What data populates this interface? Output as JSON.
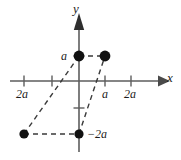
{
  "figure": {
    "kind": "cartesian-coordinate-diagram",
    "background_color": "#ffffff",
    "axis_color": "#5d5d5d",
    "dash_color": "#3a3a3a",
    "point_color": "#111111",
    "text_color": "#1c1c1c",
    "axes": {
      "x_label": "x",
      "y_label": "y",
      "origin_px": {
        "x": 79,
        "y": 81
      },
      "unit_px": 26
    },
    "x_ticks": [
      {
        "value": "-2a",
        "label": "2a",
        "px": 24
      },
      {
        "value": "-a",
        "label": "",
        "px": 52
      },
      {
        "value": "a",
        "label": "a",
        "px": 105
      },
      {
        "value": "2a",
        "label": "2a",
        "px": 131
      }
    ],
    "y_ticks": [
      {
        "value": "a",
        "label": "a",
        "px": 56
      },
      {
        "value": "-a",
        "label": "",
        "px": 108
      },
      {
        "value": "-2a",
        "label": "-2a",
        "px": 134
      }
    ],
    "points": [
      {
        "name": "point-top-left",
        "x_px": 79,
        "y_px": 56,
        "coords": "(0, a)"
      },
      {
        "name": "point-top-right",
        "x_px": 105,
        "y_px": 56,
        "coords": "(a, a)"
      },
      {
        "name": "point-bottom-left",
        "x_px": 24,
        "y_px": 134,
        "coords": "(-2a, -2a)"
      },
      {
        "name": "point-bottom-center",
        "x_px": 79,
        "y_px": 134,
        "coords": "(0, -2a)"
      }
    ],
    "dashed_connectors": [
      {
        "name": "top-horizontal",
        "from": "(0, a)",
        "to": "(a, a)"
      },
      {
        "name": "bottom-horizontal",
        "from": "(-2a, -2a)",
        "to": "(0, -2a)"
      },
      {
        "name": "left-diagonal",
        "from": "(-2a, -2a)",
        "to": "(0, a)"
      },
      {
        "name": "right-diagonal",
        "from": "(0, -2a)",
        "to": "(a, a)"
      }
    ],
    "labels": {
      "y_tick_a": "a",
      "x_tick_neg2a": "2a",
      "x_tick_a": "a",
      "x_tick_2a": "2a",
      "point_neg2a": "−2a"
    }
  }
}
